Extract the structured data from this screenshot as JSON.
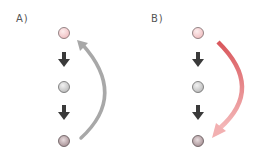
{
  "panels": [
    {
      "label": "A)",
      "nodes": [
        {
          "name": "top",
          "color": "#f2c6c8"
        },
        {
          "name": "middle",
          "color": "#c9c9c9"
        },
        {
          "name": "bottom",
          "color": "#b5a0a3"
        }
      ],
      "step_arrows": [
        "down",
        "down"
      ],
      "feedback_arrow": {
        "direction": "bottom-to-top",
        "color": "#a8a8a8"
      }
    },
    {
      "label": "B)",
      "nodes": [
        {
          "name": "top",
          "color": "#f2c6c8"
        },
        {
          "name": "middle",
          "color": "#c9c9c9"
        },
        {
          "name": "bottom",
          "color": "#c3a5aa"
        }
      ],
      "step_arrows": [
        "down",
        "down"
      ],
      "feedback_arrow": {
        "direction": "top-to-bottom",
        "color_start": "#d9575c",
        "color_end": "#f2b3b4"
      }
    }
  ]
}
